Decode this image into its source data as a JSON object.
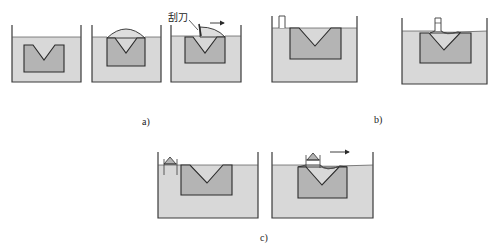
{
  "figure": {
    "panels": [
      {
        "id": "a",
        "caption": "a)",
        "steps": 3,
        "annotation": "刮刀"
      },
      {
        "id": "b",
        "caption": "b)",
        "steps": 2
      },
      {
        "id": "c",
        "caption": "c)",
        "steps": 2
      }
    ],
    "colors": {
      "liquid": "#d8d8d8",
      "part": "#b4b4b4",
      "outline": "#2a2a2a",
      "background": "#ffffff"
    }
  }
}
